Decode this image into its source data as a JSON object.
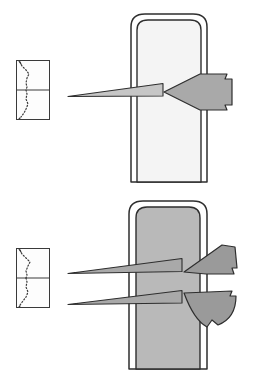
{
  "figure": {
    "title": "Wedge splitting schematic",
    "width": 254,
    "height": 382,
    "background_color": "#ffffff",
    "ink_color": "#2a2a2a",
    "panel_count": 2
  },
  "colors": {
    "background": "#ffffff",
    "outline": "#2e2e2e",
    "outline_soft": "#555555",
    "specimen_fill_top": "#f4f4f4",
    "specimen_fill_bottom": "#b9b9b9",
    "blade_fill_light": "#c6c6c6",
    "blade_fill_mid": "#a9a9a9",
    "blade_fill_dark": "#9a9a9a",
    "crack_color": "#3a3a3a",
    "key_box_fill": "#fdfdfd"
  },
  "panels": [
    {
      "id": "panel-top",
      "name": "single-blade-panel",
      "label": "",
      "key_box": {
        "name": "key-box-top",
        "x": 16,
        "y": 60,
        "width": 34,
        "height": 60,
        "divider_y": 90,
        "fill": "#fdfdfd",
        "stroke": "#3a3a3a",
        "crack_style": "dotted",
        "crack_segments": 2,
        "description": "two-cell schematic with dotted crack path"
      },
      "specimen": {
        "name": "specimen-top",
        "x": 131,
        "y": 14,
        "width": 76,
        "height": 168,
        "fill": "#f4f4f4",
        "stroke": "#2e2e2e",
        "corner_radius_top": 12,
        "corner_radius_bottom": 0,
        "double_outline": true,
        "outline_gap": 5
      },
      "blades": [
        {
          "name": "blade-left-top",
          "type": "long-taper-blade",
          "direction": "right",
          "tip_x": 68,
          "tip_y": 93,
          "base_x": 162,
          "base_y": 93,
          "thickness": 13,
          "fill": "#c6c6c6"
        },
        {
          "name": "blade-right-top",
          "type": "wedge-head",
          "direction": "left",
          "tip_x": 164,
          "tip_y": 92,
          "base_x": 234,
          "base_y": 92,
          "thickness": 36,
          "fill": "#a9a9a9",
          "notched": true
        }
      ],
      "crack": {
        "name": "crack-line-top",
        "visible": false
      }
    },
    {
      "id": "panel-bottom",
      "name": "double-blade-panel",
      "label": "",
      "key_box": {
        "name": "key-box-bottom",
        "x": 16,
        "y": 248,
        "width": 34,
        "height": 60,
        "divider_y": 278,
        "fill": "#fdfdfd",
        "stroke": "#3a3a3a",
        "crack_style": "dotted",
        "crack_segments": 2,
        "description": "two-cell schematic with dotted crack path"
      },
      "specimen": {
        "name": "specimen-bottom",
        "x": 131,
        "y": 201,
        "width": 76,
        "height": 168,
        "fill": "#b9b9b9",
        "stroke": "#2e2e2e",
        "corner_radius_top": 12,
        "corner_radius_bottom": 0,
        "double_outline": true,
        "outline_gap": 5
      },
      "blades": [
        {
          "name": "blade-left-upper-bottom",
          "type": "long-taper-blade",
          "direction": "right",
          "tip_x": 68,
          "tip_y": 270,
          "base_x": 180,
          "base_y": 265,
          "thickness": 14,
          "fill": "#a9a9a9"
        },
        {
          "name": "blade-left-lower-bottom",
          "type": "long-taper-blade",
          "direction": "right",
          "tip_x": 68,
          "tip_y": 302,
          "base_x": 180,
          "base_y": 298,
          "thickness": 14,
          "fill": "#a9a9a9"
        },
        {
          "name": "wedge-right-upper-bottom",
          "type": "triangular-wedge",
          "direction": "left",
          "tip_x": 184,
          "tip_y": 272,
          "base_x": 238,
          "base_y": 246,
          "fill": "#9a9a9a",
          "notched": true
        },
        {
          "name": "wedge-right-lower-bottom",
          "type": "round-bottom-wedge",
          "direction": "left",
          "tip_x": 184,
          "tip_y": 295,
          "base_x": 238,
          "base_y": 320,
          "fill": "#9a9a9a",
          "notched": true
        }
      ],
      "crack": {
        "name": "crack-line-bottom",
        "visible": false
      }
    }
  ]
}
